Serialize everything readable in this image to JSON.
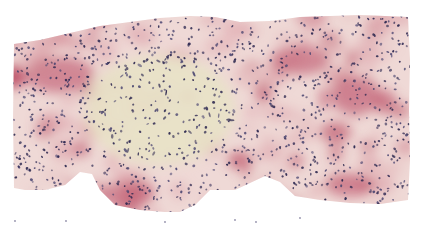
{
  "image": {
    "kind": "histology-micrograph",
    "stain": "H&E-like (pink cytoplasm, blue-purple nuclei)",
    "background_color": "#ffffff",
    "colors": {
      "tissue_base": "#efd9d6",
      "tissue_pink": "#dca0a8",
      "tissue_red": "#b8455e",
      "stroma_yellow": "#e8e2c6",
      "nucleus_dark": "#2d2850",
      "nucleus_mid": "#4a4570"
    },
    "tissue_outline": [
      [
        14,
        44
      ],
      [
        40,
        40
      ],
      [
        70,
        33
      ],
      [
        100,
        26
      ],
      [
        130,
        22
      ],
      [
        160,
        18
      ],
      [
        190,
        16
      ],
      [
        215,
        17
      ],
      [
        240,
        22
      ],
      [
        270,
        21
      ],
      [
        300,
        17
      ],
      [
        330,
        16
      ],
      [
        360,
        15
      ],
      [
        385,
        16
      ],
      [
        408,
        17
      ],
      [
        410,
        60
      ],
      [
        409,
        110
      ],
      [
        410,
        160
      ],
      [
        408,
        200
      ],
      [
        380,
        204
      ],
      [
        350,
        203
      ],
      [
        320,
        200
      ],
      [
        295,
        196
      ],
      [
        280,
        182
      ],
      [
        265,
        176
      ],
      [
        250,
        183
      ],
      [
        235,
        190
      ],
      [
        210,
        190
      ],
      [
        195,
        205
      ],
      [
        180,
        212
      ],
      [
        165,
        212
      ],
      [
        140,
        210
      ],
      [
        115,
        205
      ],
      [
        100,
        190
      ],
      [
        92,
        174
      ],
      [
        80,
        172
      ],
      [
        65,
        185
      ],
      [
        45,
        190
      ],
      [
        25,
        190
      ],
      [
        14,
        188
      ],
      [
        13,
        120
      ]
    ],
    "regions": [
      {
        "name": "fibrotic-stroma",
        "cx": 160,
        "cy": 110,
        "rx": 75,
        "ry": 55
      },
      {
        "name": "red-focus-1",
        "cx": 60,
        "cy": 75,
        "rx": 35,
        "ry": 18
      },
      {
        "name": "red-focus-2",
        "cx": 300,
        "cy": 60,
        "rx": 30,
        "ry": 15
      },
      {
        "name": "red-focus-3",
        "cx": 355,
        "cy": 95,
        "rx": 25,
        "ry": 20
      },
      {
        "name": "red-focus-4",
        "cx": 125,
        "cy": 195,
        "rx": 30,
        "ry": 12
      },
      {
        "name": "red-focus-5",
        "cx": 350,
        "cy": 185,
        "rx": 25,
        "ry": 12
      }
    ],
    "debris": [
      [
        15,
        221
      ],
      [
        66,
        221
      ],
      [
        165,
        222
      ],
      [
        235,
        220
      ],
      [
        256,
        222
      ],
      [
        300,
        218
      ]
    ]
  }
}
